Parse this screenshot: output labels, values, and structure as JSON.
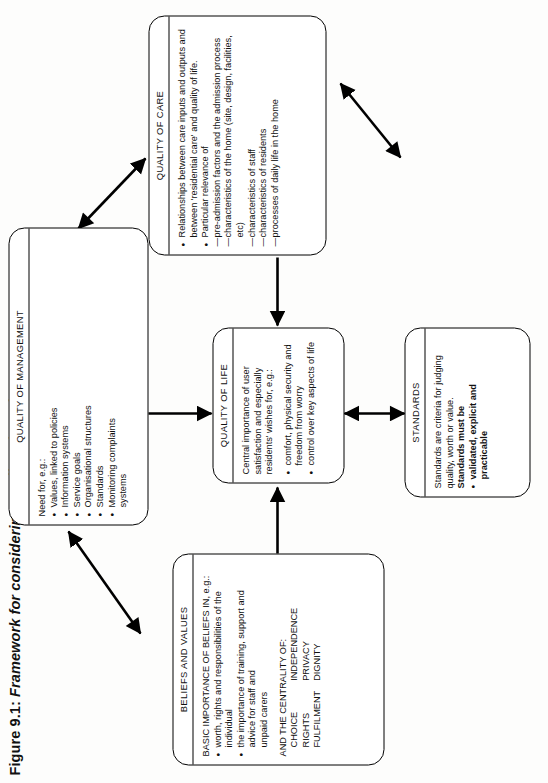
{
  "figure": {
    "label": "Figure 9.1:",
    "caption": "Framework for considering quality of service"
  },
  "boxes": {
    "beliefs": {
      "title": "BELIEFS AND VALUES",
      "lead": "BASIC IMPORTANCE OF BELIEFS IN, e.g.:",
      "bullets": [
        "worth, rights and responsibilities of the individual",
        "the importance of training, support and advice for staff and"
      ],
      "bullet2_cont": "unpaid carers",
      "centrality_lead": "AND THE CENTRALITY OF:",
      "centrality_col1": [
        "CHOICE",
        "RIGHTS",
        "FULFILMENT"
      ],
      "centrality_col2": [
        "INDEPENDENCE",
        "PRIVACY",
        "DIGNITY"
      ]
    },
    "management": {
      "title": "QUALITY OF MANAGEMENT",
      "lead": "Need for, e.g.:",
      "bullets": [
        "Values, linked to policies",
        "Information systems",
        "Service goals",
        "Organisational structures",
        "Standards",
        "Monitoring complaints"
      ],
      "last_cont": "systems"
    },
    "life": {
      "title": "QUALITY OF LIFE",
      "lead1": "Central importance of user satisfaction and especially",
      "lead2": "residents' wishes for, e.g.:",
      "bullets": [
        "comfort, physical security and freedom from worry",
        "control over key aspects of life"
      ]
    },
    "care": {
      "title": "QUALITY OF CARE",
      "bullets": [
        "Relationships between care inputs and outputs and",
        "Particular relevance of"
      ],
      "bullet1_cont": "between 'residential care' and quality of life.",
      "dashes": [
        "pre-admission factors and the admission process",
        "characteristics of the home (site, design, facilities, etc)",
        "characteristics of staff",
        "characteristics of residents",
        "processes of daily life in the home"
      ]
    },
    "standards": {
      "title": "STANDARDS",
      "line1": "Standards are criteria for judging",
      "line2": "quality, worth or value.",
      "line3": "Standards must be",
      "bullet1": "validated, explicit and practicable"
    }
  },
  "connections": [
    {
      "name": "beliefs-to-management",
      "heads": "both"
    },
    {
      "name": "beliefs-to-life",
      "heads": "end"
    },
    {
      "name": "management-to-life",
      "heads": "end"
    },
    {
      "name": "management-to-care",
      "heads": "both"
    },
    {
      "name": "care-to-life",
      "heads": "end"
    },
    {
      "name": "standards-to-care",
      "heads": "both"
    },
    {
      "name": "beliefs-to-standards",
      "heads": "both"
    }
  ],
  "colors": {
    "ink": "#000000",
    "paper": "#fdfdfc"
  }
}
